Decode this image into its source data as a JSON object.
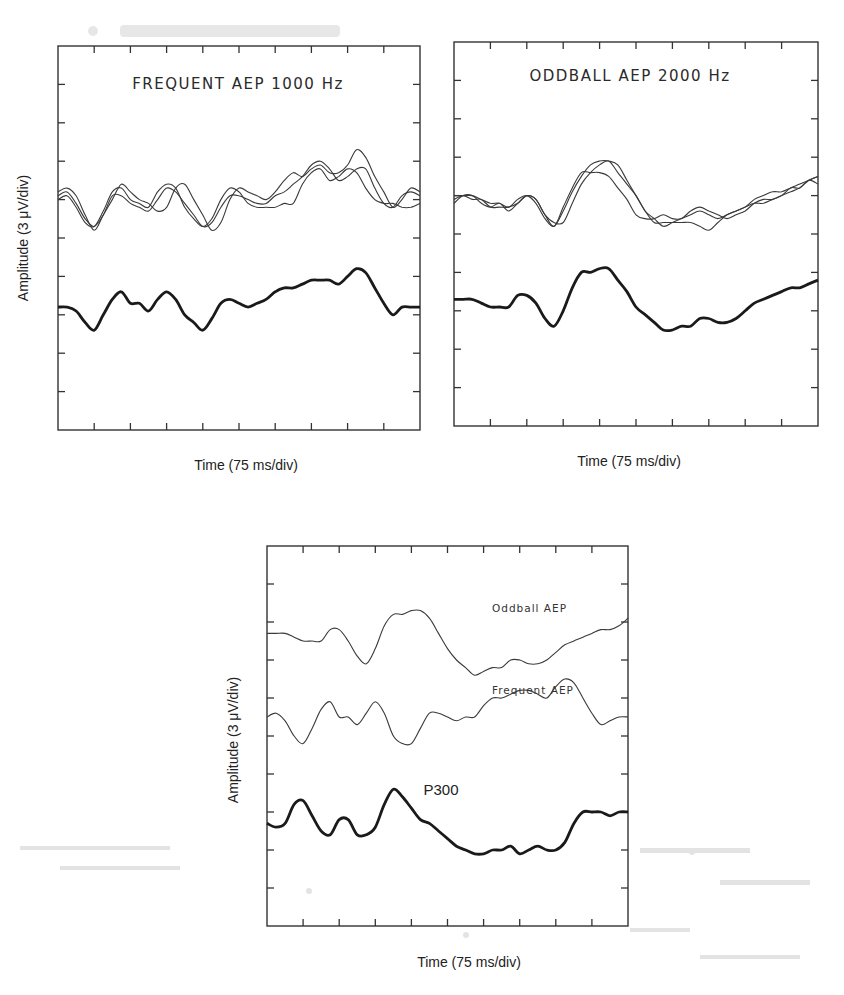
{
  "chart_data": [
    {
      "type": "line",
      "id": "frequent",
      "title": "FREQUENT AEP 1000 Hz",
      "xlabel": "Time (75 ms/div)",
      "ylabel": "Amplitude (3 μV/div)",
      "x_divisions": 10,
      "y_divisions": 10,
      "grid": false,
      "x": [
        0,
        0.25,
        0.5,
        0.75,
        1,
        1.25,
        1.5,
        1.75,
        2,
        2.25,
        2.5,
        2.75,
        3,
        3.25,
        3.5,
        3.75,
        4,
        4.25,
        4.5,
        4.75,
        5,
        5.25,
        5.5,
        5.75,
        6,
        6.25,
        6.5,
        6.75,
        7,
        7.25,
        7.5,
        7.75,
        8,
        8.25,
        8.5,
        8.75,
        9,
        9.25,
        9.5,
        9.75,
        10
      ],
      "series": [
        {
          "name": "Frequent trial 1",
          "style": "thin",
          "values": [
            6.2,
            6.3,
            6.1,
            5.6,
            5.2,
            5.6,
            6.0,
            6.4,
            6.2,
            6.0,
            5.9,
            5.7,
            5.8,
            6.3,
            6.4,
            6.0,
            5.6,
            5.2,
            5.4,
            6.0,
            6.3,
            6.2,
            6.1,
            6.0,
            6.2,
            6.5,
            6.7,
            6.6,
            6.8,
            6.9,
            6.7,
            6.7,
            6.9,
            7.3,
            7.1,
            6.6,
            6.2,
            5.8,
            6.0,
            6.3,
            6.2
          ]
        },
        {
          "name": "Frequent trial 2",
          "style": "thin",
          "values": [
            6.1,
            6.2,
            5.9,
            5.5,
            5.3,
            5.6,
            6.1,
            6.1,
            5.9,
            5.8,
            5.7,
            6.0,
            6.3,
            6.2,
            5.9,
            5.6,
            5.3,
            5.4,
            5.8,
            6.1,
            6.1,
            6.0,
            5.9,
            5.9,
            6.1,
            6.2,
            6.4,
            6.6,
            6.9,
            7.0,
            6.8,
            6.5,
            6.6,
            6.8,
            6.8,
            6.3,
            5.9,
            5.8,
            6.1,
            6.2,
            6.1
          ]
        },
        {
          "name": "Frequent trial 3",
          "style": "thin",
          "values": [
            6.0,
            6.1,
            5.8,
            5.4,
            5.3,
            5.7,
            6.2,
            6.3,
            6.0,
            5.9,
            5.8,
            6.2,
            6.4,
            6.3,
            5.8,
            5.5,
            5.3,
            5.5,
            6.0,
            6.3,
            6.2,
            5.9,
            5.8,
            5.8,
            5.8,
            5.9,
            5.9,
            6.4,
            6.7,
            6.8,
            6.5,
            6.6,
            6.8,
            6.7,
            6.3,
            6.0,
            5.9,
            5.9,
            5.8,
            5.8,
            5.9
          ]
        },
        {
          "name": "Frequent average",
          "style": "thick",
          "values": [
            3.2,
            3.2,
            3.1,
            2.8,
            2.6,
            3.0,
            3.4,
            3.6,
            3.3,
            3.3,
            3.1,
            3.4,
            3.6,
            3.4,
            3.0,
            2.8,
            2.6,
            2.9,
            3.3,
            3.4,
            3.3,
            3.2,
            3.3,
            3.4,
            3.6,
            3.7,
            3.7,
            3.8,
            3.9,
            3.9,
            3.9,
            3.8,
            4.0,
            4.2,
            4.1,
            3.7,
            3.3,
            3.0,
            3.2,
            3.2,
            3.2
          ]
        }
      ]
    },
    {
      "type": "line",
      "id": "oddball",
      "title": "ODDBALL AEP 2000 Hz",
      "xlabel": "Time (75 ms/div)",
      "ylabel": "",
      "x_divisions": 10,
      "y_divisions": 10,
      "grid": false,
      "x": [
        0,
        0.25,
        0.5,
        0.75,
        1,
        1.25,
        1.5,
        1.75,
        2,
        2.25,
        2.5,
        2.75,
        3,
        3.25,
        3.5,
        3.75,
        4,
        4.25,
        4.5,
        4.75,
        5,
        5.25,
        5.5,
        5.75,
        6,
        6.25,
        6.5,
        6.75,
        7,
        7.25,
        7.5,
        7.75,
        8,
        8.25,
        8.5,
        8.75,
        9,
        9.25,
        9.5,
        9.75,
        10
      ],
      "series": [
        {
          "name": "Oddball trial 1",
          "style": "thin",
          "values": [
            6.0,
            6.0,
            6.0,
            5.9,
            5.8,
            5.8,
            5.7,
            5.9,
            6.0,
            5.8,
            5.4,
            5.2,
            5.6,
            6.1,
            6.5,
            6.8,
            6.9,
            6.9,
            6.8,
            6.4,
            6.0,
            5.6,
            5.4,
            5.2,
            5.3,
            5.4,
            5.5,
            5.6,
            5.5,
            5.4,
            5.5,
            5.6,
            5.7,
            5.9,
            6.0,
            6.1,
            6.1,
            6.2,
            6.3,
            6.4,
            6.5
          ]
        },
        {
          "name": "Oddball trial 2",
          "style": "thin",
          "values": [
            5.9,
            6.0,
            5.9,
            5.9,
            5.7,
            5.7,
            5.7,
            5.8,
            6.0,
            5.9,
            5.5,
            5.2,
            5.7,
            6.2,
            6.6,
            6.6,
            6.6,
            6.5,
            6.2,
            5.9,
            5.5,
            5.4,
            5.4,
            5.5,
            5.4,
            5.4,
            5.6,
            5.7,
            5.6,
            5.5,
            5.4,
            5.5,
            5.6,
            5.8,
            5.9,
            5.9,
            6.0,
            6.2,
            6.2,
            6.4,
            6.3
          ]
        },
        {
          "name": "Oddball trial 3",
          "style": "thin",
          "values": [
            5.8,
            6.0,
            6.0,
            5.8,
            5.7,
            5.8,
            5.6,
            5.8,
            6.0,
            5.9,
            5.5,
            5.3,
            5.3,
            5.8,
            6.3,
            6.6,
            6.8,
            6.9,
            6.6,
            6.3,
            6.0,
            5.6,
            5.3,
            5.3,
            5.3,
            5.3,
            5.3,
            5.2,
            5.1,
            5.3,
            5.5,
            5.6,
            5.7,
            5.8,
            5.8,
            5.9,
            6.0,
            6.1,
            6.2,
            6.4,
            6.5
          ]
        },
        {
          "name": "Oddball average",
          "style": "thick",
          "values": [
            3.3,
            3.3,
            3.3,
            3.2,
            3.1,
            3.1,
            3.1,
            3.4,
            3.4,
            3.2,
            2.8,
            2.6,
            3.0,
            3.6,
            4.0,
            4.0,
            4.1,
            4.1,
            3.8,
            3.5,
            3.1,
            2.9,
            2.7,
            2.5,
            2.5,
            2.6,
            2.6,
            2.8,
            2.8,
            2.7,
            2.7,
            2.8,
            3.0,
            3.2,
            3.3,
            3.4,
            3.5,
            3.6,
            3.6,
            3.7,
            3.8
          ]
        }
      ]
    },
    {
      "type": "line",
      "id": "difference",
      "title": "",
      "xlabel": "Time (75 ms/div)",
      "ylabel": "Amplitude (3 μV/div)",
      "x_divisions": 10,
      "y_divisions": 10,
      "grid": false,
      "annotations": [
        {
          "text": "Oddball AEP",
          "x": 6.2,
          "y": 8.6
        },
        {
          "text": "Frequent AEP",
          "x": 6.2,
          "y": 6.6
        },
        {
          "text": "P300",
          "x": 4.2,
          "y": 3.6
        }
      ],
      "x": [
        0,
        0.25,
        0.5,
        0.75,
        1,
        1.25,
        1.5,
        1.75,
        2,
        2.25,
        2.5,
        2.75,
        3,
        3.25,
        3.5,
        3.75,
        4,
        4.25,
        4.5,
        4.75,
        5,
        5.25,
        5.5,
        5.75,
        6,
        6.25,
        6.5,
        6.75,
        7,
        7.25,
        7.5,
        7.75,
        8,
        8.25,
        8.5,
        8.75,
        9,
        9.25,
        9.5,
        9.75,
        10
      ],
      "series": [
        {
          "name": "Oddball AEP",
          "style": "thin",
          "values": [
            7.7,
            7.7,
            7.7,
            7.6,
            7.5,
            7.5,
            7.5,
            7.8,
            7.8,
            7.5,
            7.1,
            6.9,
            7.3,
            7.9,
            8.2,
            8.2,
            8.3,
            8.3,
            8.1,
            7.7,
            7.3,
            7.0,
            6.8,
            6.6,
            6.7,
            6.8,
            6.8,
            7.0,
            7.0,
            6.9,
            6.9,
            7.0,
            7.2,
            7.4,
            7.5,
            7.6,
            7.7,
            7.8,
            7.8,
            7.9,
            8.1
          ]
        },
        {
          "name": "Frequent AEP",
          "style": "thin",
          "values": [
            5.5,
            5.6,
            5.4,
            5.0,
            4.8,
            5.2,
            5.7,
            5.9,
            5.5,
            5.5,
            5.3,
            5.6,
            5.9,
            5.6,
            5.0,
            4.8,
            4.8,
            5.2,
            5.6,
            5.6,
            5.5,
            5.4,
            5.5,
            5.5,
            5.8,
            6.0,
            6.0,
            6.1,
            6.2,
            6.2,
            6.1,
            6.0,
            6.3,
            6.5,
            6.4,
            6.0,
            5.6,
            5.3,
            5.4,
            5.5,
            5.5
          ]
        },
        {
          "name": "P300 (Oddball − Frequent)",
          "style": "thick",
          "values": [
            2.7,
            2.6,
            2.7,
            3.2,
            3.3,
            2.9,
            2.5,
            2.4,
            2.8,
            2.8,
            2.4,
            2.4,
            2.6,
            3.2,
            3.6,
            3.4,
            3.1,
            2.8,
            2.7,
            2.5,
            2.3,
            2.1,
            2.0,
            1.9,
            1.9,
            2.0,
            2.0,
            2.1,
            1.9,
            2.0,
            2.1,
            2.0,
            2.0,
            2.2,
            2.7,
            3.0,
            3.0,
            3.0,
            2.9,
            3.0,
            3.0
          ]
        }
      ]
    }
  ],
  "figure": {
    "panels": [
      {
        "title": "FREQUENT AEP 1000 Hz",
        "xlabel": "Time (75 ms/div)",
        "ylabel": "Amplitude (3 μV/div)"
      },
      {
        "title": "ODDBALL AEP 2000 Hz",
        "xlabel": "Time (75 ms/div)",
        "ylabel": ""
      },
      {
        "title": "",
        "xlabel": "Time (75 ms/div)",
        "ylabel": "Amplitude (3 μV/div)",
        "labels": {
          "oddball": "Oddball AEP",
          "frequent": "Frequent AEP",
          "p300": "P300"
        }
      }
    ]
  }
}
